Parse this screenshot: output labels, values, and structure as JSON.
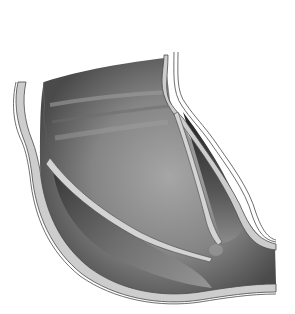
{
  "illustration": {
    "subject": "vein cross-section with bicuspid valve",
    "style": "grayscale anatomical drawing",
    "colors": {
      "background": "#ffffff",
      "lumen_dark": "#3a3a3a",
      "lumen_mid": "#7a7a7a",
      "lumen_light": "#a8a8a8",
      "wall_fill": "#c8c8c8",
      "wall_outline": "#4a4a4a",
      "leaflet_fill": "#d2d2d2"
    }
  }
}
